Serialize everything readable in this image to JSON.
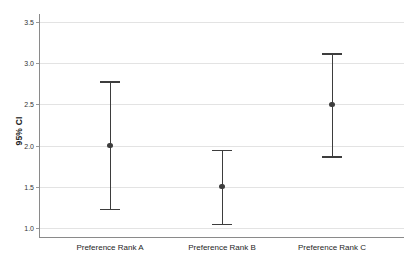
{
  "chart_data": {
    "type": "scatter",
    "title": "",
    "subtitle": "",
    "xlabel": "",
    "ylabel": "95% CI",
    "categories": [
      "Preference Rank A",
      "Preference Rank B",
      "Preference Rank C"
    ],
    "series": [
      {
        "name": "Mean with 95% CI",
        "values": [
          2.0,
          1.5,
          2.5
        ],
        "ci_lower": [
          1.23,
          1.05,
          1.87
        ],
        "ci_upper": [
          2.78,
          1.95,
          3.12
        ]
      }
    ],
    "ylim": [
      1.0,
      3.5
    ],
    "yticks": [
      1.0,
      1.5,
      2.0,
      2.5,
      3.0,
      3.5
    ],
    "ytick_labels": [
      "1.0",
      "1.5",
      "2.0",
      "2.5",
      "3.0",
      "3.5"
    ],
    "grid": true,
    "grid_axis": "y",
    "legend": false,
    "legend_position": "none",
    "marker": "circle",
    "error_bar_style": "capped",
    "colors": {
      "marker": "#3d3d3d",
      "error_bar": "#3d3d3d",
      "gridline": "#e3e3e3",
      "axis": "#8a8a8a",
      "text": "#1e1e1e",
      "background": "#ffffff"
    }
  },
  "axis": {
    "y_title": "95% CI",
    "tick_labels": [
      "3.5",
      "3.0",
      "2.5",
      "2.0",
      "1.5",
      "1.0"
    ]
  },
  "categories": [
    {
      "label": "Preference Rank A"
    },
    {
      "label": "Preference Rank B"
    },
    {
      "label": "Preference Rank C"
    }
  ]
}
